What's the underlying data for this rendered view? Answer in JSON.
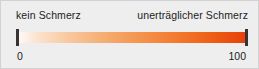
{
  "widget": {
    "type": "visual-analog-pain-scale",
    "background_color": "#eeeeee",
    "border_color": "#d2d2d2"
  },
  "labels": {
    "left": "kein Schmerz",
    "right": "unerträglicher Schmerz"
  },
  "scale": {
    "min_value": "0",
    "max_value": "100",
    "gradient_start_color": "#fdfbf9",
    "gradient_mid_color": "#f4914a",
    "gradient_end_color": "#e8400a",
    "end_cap_color": "#3b3234"
  }
}
